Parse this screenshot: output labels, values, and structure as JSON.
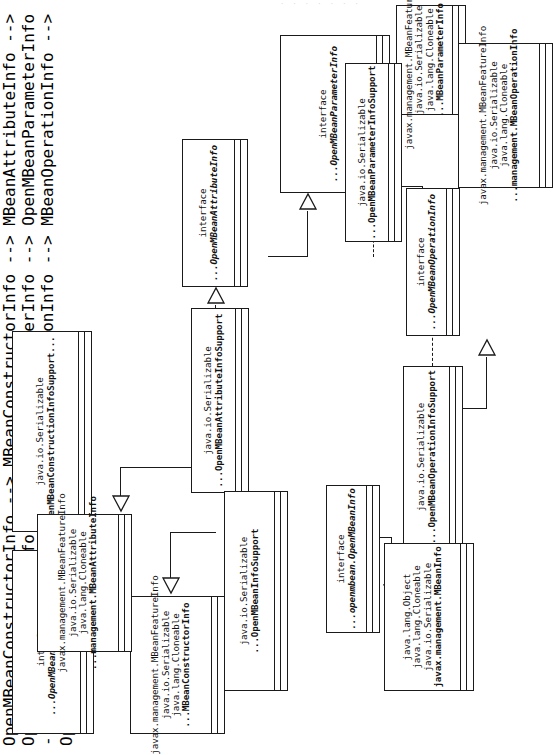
{
  "figure": {
    "type": "uml-class-diagram",
    "orientation": "rotated-90-ccw",
    "top_clipped_text": "· · · ·    ·   ·   ·"
  },
  "classes": [
    {
      "id": "open-mbean-constructor-info",
      "stereotype": "interface",
      "lines": [
        "interface",
        "...OpenMBeanConstructorInfo"
      ],
      "kind": "interface"
    },
    {
      "id": "open-mbean-construction-info-support",
      "lines": [
        "java.io.Serializable",
        "OpenMBeanConstructionInfoSupport..."
      ],
      "kind": "class"
    },
    {
      "id": "mbean-constructor-info",
      "lines": [
        "javax.management.MBeanFeatureInfo",
        "java.io.Serializable",
        "java.lang.Cloneable",
        "...MBeanConstructorInfo"
      ],
      "kind": "class"
    },
    {
      "id": "mbean-attribute-info",
      "lines": [
        "javax.management.MBeanFeatureInfo",
        "java.io.Serializable",
        "java.lang.Cloneable",
        "...management.MBeanAttributeInfo"
      ],
      "kind": "class"
    },
    {
      "id": "open-mbean-attribute-info-support",
      "lines": [
        "java.io.Serializable",
        "...OpenMBeanAttributeInfoSupport"
      ],
      "kind": "class"
    },
    {
      "id": "open-mbean-attribute-info",
      "stereotype": "interface",
      "lines": [
        "interface",
        "...OpenMBeanAttributeInfo"
      ],
      "kind": "interface"
    },
    {
      "id": "open-mbean-parameter-info",
      "stereotype": "interface",
      "lines": [
        "interface",
        "...OpenMBeanParameterInfo"
      ],
      "kind": "interface"
    },
    {
      "id": "mbean-parameter-info",
      "lines": [
        "javax.management.MBeanFeatureInfo",
        "java.io.Serializable",
        "java.lang.Cloneable",
        "...MBeanParameterInfo"
      ],
      "kind": "class"
    },
    {
      "id": "open-mbean-parameter-info-support",
      "lines": [
        "java.io.Serializable",
        "...OpenMBeanParameterInfoSupport"
      ],
      "kind": "class"
    },
    {
      "id": "open-mbean-operation-info",
      "stereotype": "interface",
      "lines": [
        "interface",
        "...OpenMBeanOperationInfo"
      ],
      "kind": "interface"
    },
    {
      "id": "mbean-operation-info",
      "lines": [
        "javax.management.MBeanFeatureInfo",
        "java.io.Serializable",
        "java.lang.Cloneable",
        "...management.MBeanOperationInfo"
      ],
      "kind": "class"
    },
    {
      "id": "open-mbean-operation-info-support",
      "lines": [
        "java.io.Serializable",
        "...OpenMBeanOperationInfoSupport"
      ],
      "kind": "class"
    },
    {
      "id": "open-mbean-info",
      "stereotype": "interface",
      "lines": [
        "interface",
        "...openmbean.OpenMBeanInfo"
      ],
      "kind": "interface"
    },
    {
      "id": "mbean-info",
      "lines": [
        "java.lang.Object",
        "java.lang.Cloneable",
        "java.io.Serializable",
        "javax.management.MBeanInfo"
      ],
      "kind": "class"
    },
    {
      "id": "open-mbean-info-support",
      "lines": [
        "java.io.Serializable",
        "...OpenMBeanInfoSupport"
      ],
      "kind": "class"
    }
  ],
  "relations": [
    {
      "from": "open-mbean-construction-info-support",
      "to": "open-mbean-constructor-info",
      "type": "realization"
    },
    {
      "from": "open-mbean-construction-info-support",
      "to": "mbean-constructor-info",
      "type": "generalization"
    },
    {
      "from": "open-mbean-attribute-info-support",
      "to": "mbean-attribute-info",
      "type": "generalization"
    },
    {
      "from": "open-mbean-attribute-info-support",
      "to": "open-mbean-attribute-info",
      "type": "realization"
    },
    {
      "from": "open-mbean-attribute-info",
      "to": "open-mbean-parameter-info",
      "type": "generalization"
    },
    {
      "from": "open-mbean-parameter-info-support",
      "to": "open-mbean-parameter-info",
      "type": "realization"
    },
    {
      "from": "open-mbean-parameter-info-support",
      "to": "mbean-parameter-info",
      "type": "generalization"
    },
    {
      "from": "open-mbean-operation-info-support",
      "to": "open-mbean-operation-info",
      "type": "realization"
    },
    {
      "from": "open-mbean-operation-info-support",
      "to": "mbean-operation-info",
      "type": "generalization"
    },
    {
      "from": "open-mbean-info-support",
      "to": "open-mbean-info",
      "type": "realization"
    },
    {
      "from": "open-mbean-info-support",
      "to": "mbean-info",
      "type": "generalization"
    }
  ],
  "colors": {
    "stroke": "#1a1a1a",
    "fill": "#ffffff",
    "text": "#111111"
  }
}
